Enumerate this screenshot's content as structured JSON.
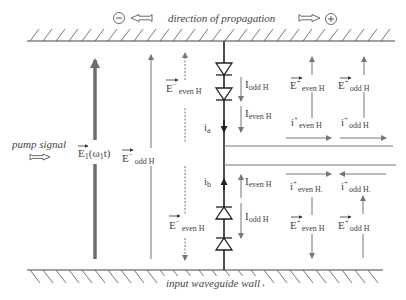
{
  "header": {
    "title": "direction of propagation",
    "minus_symbol": "−",
    "plus_symbol": "+"
  },
  "walls": {
    "bottom_label": "input waveguide wall",
    "bottom_marker": "›"
  },
  "left": {
    "pump_label": "pump signal",
    "pump_field": {
      "base": "E",
      "sub": "1",
      "arg": "(ω",
      "arg_sub": "1",
      "arg_end": "t)"
    },
    "odd_field": {
      "base": "E",
      "sup": "−",
      "sub": "odd H"
    },
    "even_field_top": {
      "base": "E",
      "sup": "−",
      "sub": "even H"
    },
    "even_field_bottom": {
      "base": "E",
      "sup": "−",
      "sub": "even H"
    }
  },
  "diodes": {
    "top_currents": {
      "odd": {
        "base": "I",
        "sub": "odd H"
      },
      "even": {
        "base": "I",
        "sub": "even H"
      }
    },
    "bottom_currents": {
      "even": {
        "base": "I",
        "sub": "even H"
      },
      "odd": {
        "base": "I",
        "sub": "odd H"
      }
    },
    "ia": {
      "base": "i",
      "sub": "a"
    },
    "ib": {
      "base": "i",
      "sub": "b"
    }
  },
  "right_top": {
    "e_even": {
      "base": "E",
      "sup": "+",
      "sub": "even H"
    },
    "e_odd": {
      "base": "E",
      "sup": "+",
      "sub": "odd H"
    },
    "i_even": {
      "base": "i",
      "sup": "+",
      "sub": "even H"
    },
    "i_odd": {
      "base": "i",
      "sup": "+",
      "sub": "odd H"
    }
  },
  "right_bottom": {
    "i_even": {
      "base": "i",
      "sup": "+",
      "sub": "even H."
    },
    "i_odd": {
      "base": "i",
      "sup": "+",
      "sub": "odd H."
    },
    "e_even": {
      "base": "E",
      "sup": "+",
      "sub": "even H"
    },
    "e_odd": {
      "base": "E",
      "sup": "+",
      "sub": "odd H"
    }
  },
  "colors": {
    "line": "#333333",
    "arrow": "#777777",
    "pump_arrow": "#6e6e6e",
    "text": "#444444"
  }
}
